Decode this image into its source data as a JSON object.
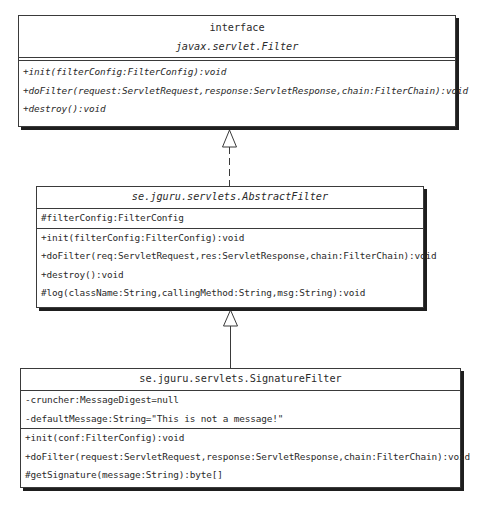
{
  "diagram": {
    "type": "uml-class-diagram",
    "classes": [
      {
        "id": "filter",
        "stereotype": "interface",
        "name": "javax.servlet.Filter",
        "name_italic": true,
        "attributes": [],
        "methods": [
          "+init(filterConfig:FilterConfig):void",
          "+doFilter(request:ServletRequest,response:ServletResponse,chain:FilterChain):void",
          "+destroy():void"
        ],
        "methods_italic": true
      },
      {
        "id": "abstract-filter",
        "stereotype": "",
        "name": "se.jguru.servlets.AbstractFilter",
        "name_italic": true,
        "attributes": [
          "#filterConfig:FilterConfig"
        ],
        "methods": [
          "+init(filterConfig:FilterConfig):void",
          "+doFilter(req:ServletRequest,res:ServletResponse,chain:FilterChain):void",
          "+destroy():void",
          "#log(className:String,callingMethod:String,msg:String):void"
        ],
        "methods_italic": false
      },
      {
        "id": "signature-filter",
        "stereotype": "",
        "name": "se.jguru.servlets.SignatureFilter",
        "name_italic": false,
        "attributes": [
          "-cruncher:MessageDigest=null",
          "-defaultMessage:String=\"This is not a message!\""
        ],
        "methods": [
          "+init(conf:FilterConfig):void",
          "+doFilter(request:ServletRequest,response:ServletResponse,chain:FilterChain):void",
          "#getSignature(message:String):byte[]"
        ],
        "methods_italic": false
      }
    ],
    "relationships": [
      {
        "from": "abstract-filter",
        "to": "filter",
        "kind": "realization",
        "line": "dashed",
        "arrowhead": "hollow-triangle"
      },
      {
        "from": "signature-filter",
        "to": "abstract-filter",
        "kind": "generalization",
        "line": "solid",
        "arrowhead": "hollow-triangle"
      }
    ],
    "colors": {
      "line": "#3a3a3a",
      "shadow": "#1e1e1e",
      "text": "#2a2a2a",
      "background": "#ffffff"
    }
  }
}
